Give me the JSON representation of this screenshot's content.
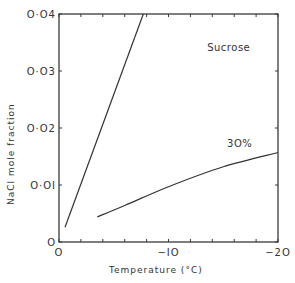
{
  "chart_data": {
    "type": "line",
    "title": "",
    "xlabel": "Temperature  (°C)",
    "ylabel": "NaCl  mole  fraction",
    "xlim": [
      0,
      -20
    ],
    "ylim": [
      0,
      0.04
    ],
    "grid": false,
    "x_ticks": [
      0,
      -2,
      -4,
      -6,
      -8,
      -10,
      -12,
      -14,
      -16,
      -18,
      -20
    ],
    "x_tick_labels": [
      {
        "value": 0,
        "label": "O"
      },
      {
        "value": -10,
        "label": "−IO"
      },
      {
        "value": -20,
        "label": "−2O"
      }
    ],
    "y_ticks": [
      0,
      0.01,
      0.02,
      0.03,
      0.04
    ],
    "y_tick_labels": [
      {
        "value": 0,
        "label": "O"
      },
      {
        "value": 0.01,
        "label": "O·OI"
      },
      {
        "value": 0.02,
        "label": "O·O2"
      },
      {
        "value": 0.03,
        "label": "O·O3"
      },
      {
        "value": 0.04,
        "label": "O·O4"
      }
    ],
    "series": [
      {
        "name": "steep-line",
        "x": [
          -0.55,
          -7.7
        ],
        "y": [
          0.0026,
          0.04
        ]
      },
      {
        "name": "30%",
        "x": [
          -3.5,
          -6,
          -10,
          -15,
          -20
        ],
        "y": [
          0.0044,
          0.0064,
          0.0097,
          0.0132,
          0.0157
        ]
      }
    ],
    "annotations": [
      {
        "text": "Sucrose",
        "x": -15.5,
        "y": 0.0335
      },
      {
        "text": "3O%",
        "x": -16.5,
        "y": 0.0167
      }
    ]
  }
}
